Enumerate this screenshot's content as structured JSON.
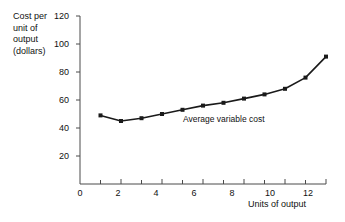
{
  "chart_data": {
    "type": "line",
    "title": "",
    "subtitle": "",
    "xlabel": "Units of output",
    "ylabel": "Cost per\nunit of\noutput\n(dollars)",
    "ylabel_lines": [
      "Cost per",
      "unit of",
      "output",
      "(dollars)"
    ],
    "x": [
      1,
      2,
      3,
      4,
      5,
      6,
      7,
      8,
      9,
      10,
      11,
      12
    ],
    "values": [
      49,
      45,
      47,
      50,
      53,
      56,
      58,
      61,
      64,
      68,
      76,
      91
    ],
    "series": [
      {
        "name": "Average variable cost",
        "values": [
          49,
          45,
          47,
          50,
          53,
          56,
          58,
          61,
          64,
          68,
          76,
          91
        ]
      }
    ],
    "annotations": [
      {
        "text": "Average variable cost",
        "x": 6.2,
        "y": 51
      }
    ],
    "xlim": [
      0,
      12
    ],
    "ylim": [
      0,
      120
    ],
    "xticks": [
      0,
      1,
      2,
      3,
      4,
      5,
      6,
      7,
      8,
      9,
      10,
      11,
      12
    ],
    "xticklabels": [
      "0",
      "",
      "2",
      "",
      "4",
      "",
      "6",
      "",
      "8",
      "",
      "10",
      "",
      "12"
    ],
    "yticks": [
      20,
      40,
      60,
      80,
      100,
      120
    ],
    "yticklabels": [
      "20",
      "40",
      "60",
      "80",
      "100",
      "120"
    ],
    "grid": false,
    "legend": "none",
    "marker": "square",
    "line_color": "#1a1a1a",
    "marker_color": "#1a1a1a",
    "axis_color": "#4a4a4a",
    "background": "#ffffff"
  },
  "axes": {
    "x_title": "Units of output",
    "y_title_lines": [
      "Cost per",
      "unit of",
      "output",
      "(dollars)"
    ],
    "y_tick_labels": [
      "120",
      "100",
      "80",
      "60",
      "40",
      "20"
    ],
    "x_tick_labels": [
      "0",
      "2",
      "4",
      "6",
      "8",
      "10",
      "12"
    ]
  },
  "annotation": {
    "series_label": "Average variable cost"
  }
}
